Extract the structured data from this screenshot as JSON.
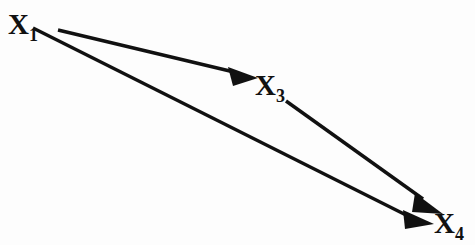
{
  "diagram": {
    "type": "directed-graph",
    "background_color": "#fdfdfd",
    "ink_color": "#111111",
    "width": 475,
    "height": 245,
    "nodes": [
      {
        "id": "x1",
        "label": "X",
        "subscript": "1",
        "full_label": "X1",
        "x": 8,
        "y": 10
      },
      {
        "id": "x3",
        "label": "X",
        "subscript": "3",
        "full_label": "X3",
        "x": 255,
        "y": 71
      },
      {
        "id": "x4",
        "label": "X",
        "subscript": "4",
        "full_label": "X4",
        "x": 434,
        "y": 209
      }
    ],
    "edges": [
      {
        "id": "edge-x1-x3",
        "from": "x1",
        "to": "x3",
        "directed": true,
        "from_point": [
          58,
          30
        ],
        "to_point": [
          257,
          78
        ]
      },
      {
        "id": "edge-x1-x4",
        "from": "x1",
        "to": "x4",
        "directed": true,
        "from_point": [
          33,
          28
        ],
        "to_point": [
          434,
          223
        ]
      },
      {
        "id": "edge-x3-x4",
        "from": "x3",
        "to": "x4",
        "directed": true,
        "from_point": [
          286,
          101
        ],
        "to_point": [
          441,
          213
        ]
      }
    ]
  }
}
